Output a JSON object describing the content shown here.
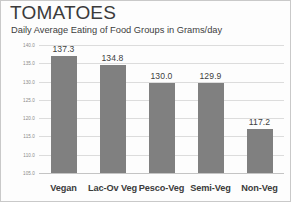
{
  "chart_data": {
    "type": "bar",
    "title": "TOMATOES",
    "subtitle": "Daily Average Eating of Food Groups in Grams/day",
    "xlabel": "",
    "ylabel": "",
    "categories": [
      "Vegan",
      "Lac-Ov Veg",
      "Pesco-Veg",
      "Semi-Veg",
      "Non-Veg"
    ],
    "values": [
      137.3,
      134.8,
      130.0,
      129.9,
      117.2
    ],
    "value_labels": [
      "137.3",
      "134.8",
      "130.0",
      "129.9",
      "117.2"
    ],
    "ylim": [
      105.0,
      140.0
    ],
    "ytick_labels": [
      "140.0",
      "135.0",
      "130.0",
      "125.0",
      "120.0",
      "115.0",
      "110.0",
      "105.0"
    ],
    "ytick_values": [
      140.0,
      135.0,
      130.0,
      125.0,
      120.0,
      115.0,
      110.0,
      105.0
    ],
    "grid": true,
    "legend": false,
    "bar_color": "#808080",
    "gridline_color": "#dcdcdc",
    "text_color": "#3b3b3b"
  }
}
